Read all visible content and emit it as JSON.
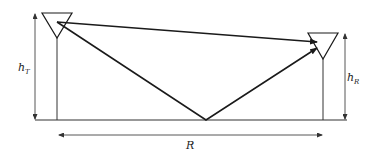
{
  "diagram": {
    "type": "two-ray ground reflection model",
    "labels": {
      "transmitter_height": "h",
      "transmitter_height_sub": "T",
      "receiver_height": "h",
      "receiver_height_sub": "R",
      "distance": "R"
    },
    "elements": {
      "transmitter": {
        "kind": "antenna",
        "top_y": 13,
        "apex": [
          57,
          38
        ],
        "base": [
          57,
          120
        ]
      },
      "receiver": {
        "kind": "antenna",
        "top_y": 33,
        "apex": [
          323,
          59
        ],
        "base": [
          323,
          120
        ]
      },
      "ground": {
        "y": 120,
        "x_start": 35,
        "x_end": 347
      },
      "direct_ray": {
        "from": [
          57,
          22
        ],
        "to": [
          318,
          42
        ]
      },
      "reflected_ray": {
        "from": [
          57,
          22
        ],
        "via": [
          206,
          120
        ],
        "to": [
          318,
          46
        ]
      }
    },
    "colors": {
      "line": "#1a1a1a",
      "background": "#ffffff"
    }
  }
}
